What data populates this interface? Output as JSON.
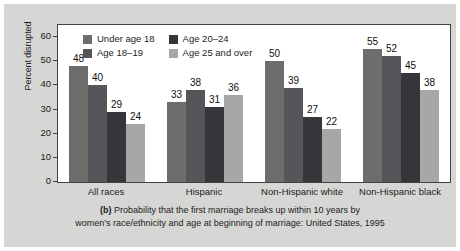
{
  "figure": {
    "panel_bg": "#d6d6d4",
    "plot_bg": "#ffffff",
    "frame_color": "#42423f"
  },
  "chart_data": {
    "type": "bar",
    "title": "",
    "xlabel": "",
    "ylabel": "Percent disrupted",
    "ylim": [
      0,
      65
    ],
    "yticks": [
      0,
      10,
      20,
      30,
      40,
      50,
      60
    ],
    "ytick_labels": [
      "0",
      "10",
      "20",
      "30",
      "40",
      "50",
      "60"
    ],
    "grid": false,
    "legend_position": "top-left inside plot",
    "categories": [
      "All races",
      "Hispanic",
      "Non-Hispanic white",
      "Non-Hispanic black"
    ],
    "series": [
      {
        "name": "Under age 18",
        "color": "#6d6d6b",
        "values": [
          48,
          33,
          50,
          55
        ]
      },
      {
        "name": "Age 18–19",
        "color": "#55555a",
        "values": [
          40,
          38,
          39,
          52
        ]
      },
      {
        "name": "Age 20–24",
        "color": "#35353a",
        "values": [
          29,
          31,
          27,
          45
        ]
      },
      {
        "name": "Age 25 and over",
        "color": "#a7a7a5",
        "values": [
          24,
          36,
          22,
          38
        ]
      }
    ],
    "annotations": [
      "48",
      "40",
      "29",
      "24",
      "33",
      "38",
      "31",
      "36",
      "50",
      "39",
      "27",
      "22",
      "55",
      "52",
      "45",
      "38"
    ]
  },
  "caption": {
    "letter": "(b)",
    "line1": "Probability that the first marriage breaks up within 10 years by",
    "line2": "women’s race/ethnicity and age at beginning of marriage: United States, 1995"
  }
}
